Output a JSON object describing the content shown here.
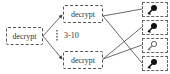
{
  "nodes": {
    "root": {
      "label": "decrypt"
    },
    "top": {
      "label": "decrypt"
    },
    "bottom": {
      "label": "decrypt"
    }
  },
  "range_label": "3-10",
  "keys": [
    {
      "icon": "key-filled-icon",
      "style": "filled"
    },
    {
      "icon": "key-filled-icon",
      "style": "filled"
    },
    {
      "icon": "key-outline-icon",
      "style": "outline"
    },
    {
      "icon": "key-filled-icon",
      "style": "filled"
    }
  ],
  "edges": [
    {
      "from": "root",
      "to": "top"
    },
    {
      "from": "root",
      "to": "bottom"
    },
    {
      "from": "top",
      "to": "key-1"
    },
    {
      "from": "top",
      "to": "key-4"
    },
    {
      "from": "bottom",
      "to": "key-2"
    },
    {
      "from": "bottom",
      "to": "key-3"
    }
  ],
  "colors": {
    "stroke": "#444444",
    "box_border": "#555555"
  }
}
